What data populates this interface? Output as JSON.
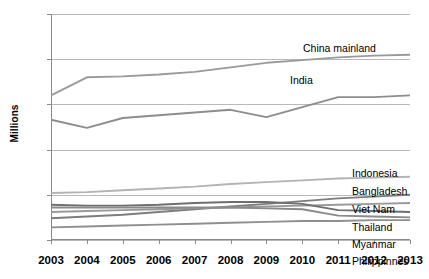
{
  "chart_data": {
    "type": "line",
    "title": "",
    "xlabel": "",
    "ylabel": "Millions",
    "x": [
      2003,
      2004,
      2005,
      2006,
      2007,
      2008,
      2009,
      2010,
      2011,
      2012,
      2013
    ],
    "xticklabels": [
      "2003",
      "2004",
      "2005",
      "2006",
      "2007",
      "2008",
      "2009",
      "2010",
      "2011",
      "2012",
      "2013"
    ],
    "yticklabels": [
      "0",
      "50",
      "100",
      "150",
      "200",
      "250"
    ],
    "yticks": [
      0,
      50,
      100,
      150,
      200,
      250
    ],
    "ylim": [
      0,
      250
    ],
    "grid": true,
    "legend_position": "right-inline-labels",
    "series": [
      {
        "name": "China mainland",
        "color": "#9a9a9a",
        "values": [
          160,
          180,
          181,
          183,
          186,
          191,
          196,
          199,
          202,
          204,
          205
        ]
      },
      {
        "name": "India",
        "color": "#8d8d8d",
        "values": [
          133,
          124,
          135,
          138,
          141,
          144,
          136,
          147,
          158,
          158,
          160
        ]
      },
      {
        "name": "Indonesia",
        "color": "#b3b3b3",
        "values": [
          52,
          53,
          55,
          57,
          59,
          62,
          64,
          66,
          68,
          69,
          70
        ]
      },
      {
        "name": "Bangladesh",
        "color": "#7d7d7d",
        "values": [
          24,
          26,
          28,
          31,
          34,
          37,
          40,
          43,
          46,
          48,
          50
        ]
      },
      {
        "name": "Viet Nam",
        "color": "#999999",
        "values": [
          31,
          32,
          33,
          34,
          35,
          36,
          37,
          38,
          39,
          40,
          41
        ]
      },
      {
        "name": "Thailand",
        "color": "#6e6e6e",
        "values": [
          39,
          38,
          38,
          39,
          41,
          42,
          42,
          40,
          33,
          32,
          31
        ]
      },
      {
        "name": "Myanmar",
        "color": "#8a8a8a",
        "values": [
          36,
          36,
          36,
          36,
          36,
          36,
          35,
          34,
          27,
          26,
          25
        ]
      },
      {
        "name": "Philippinnes",
        "color": "#8f8f8f",
        "values": [
          14,
          15,
          16,
          17,
          18,
          19,
          20,
          21,
          21,
          22,
          22
        ]
      }
    ],
    "series_labels": [
      {
        "text": "China mainland",
        "x": 303,
        "y": 42
      },
      {
        "text": "India",
        "x": 290,
        "y": 74
      },
      {
        "text": "Indonesia",
        "x": 352,
        "y": 167
      },
      {
        "text": "Bangladesh",
        "x": 352,
        "y": 185
      },
      {
        "text": "Viet Nam",
        "x": 352,
        "y": 203
      },
      {
        "text": "Thailand",
        "x": 352,
        "y": 221
      },
      {
        "text": "Myanmar",
        "x": 352,
        "y": 238
      },
      {
        "text": "Philippinnes",
        "x": 352,
        "y": 255
      }
    ]
  }
}
